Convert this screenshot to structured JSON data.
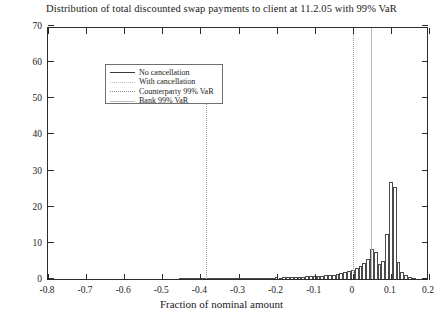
{
  "chart_data": {
    "type": "bar",
    "title": "Distribution of total discounted swap payments to client at 11.2.05 with 99% VaR",
    "xlabel": "Fraction of nominal amount",
    "ylabel": "",
    "xlim": [
      -0.8,
      0.2
    ],
    "ylim": [
      0,
      70
    ],
    "xticks": [
      -0.8,
      -0.7,
      -0.6,
      -0.5,
      -0.4,
      -0.3,
      -0.2,
      -0.1,
      0,
      0.1,
      0.2
    ],
    "xticklabels": [
      "-0.8",
      "-0.7",
      "-0.6",
      "-0.5",
      "-0.4",
      "-0.3",
      "-0.2",
      "-0.1",
      "0",
      "0.1",
      "0.2"
    ],
    "yticks": [
      0,
      10,
      20,
      30,
      40,
      50,
      60,
      70
    ],
    "yticklabels": [
      "0",
      "10",
      "20",
      "30",
      "40",
      "50",
      "60",
      "70"
    ],
    "grid": false,
    "legend_position": "upper left",
    "legend": [
      {
        "label": "No cancellation",
        "style": "solid-dark"
      },
      {
        "label": "With cancellation",
        "style": "dotted-light"
      },
      {
        "label": "Counterparty 99% VaR",
        "style": "dotted-gray"
      },
      {
        "label": "Bank 99% VaR",
        "style": "solid-gray"
      }
    ],
    "bin_width": 0.01,
    "categories": [
      -0.45,
      -0.44,
      -0.43,
      -0.42,
      -0.41,
      -0.4,
      -0.39,
      -0.38,
      -0.37,
      -0.36,
      -0.35,
      -0.34,
      -0.33,
      -0.32,
      -0.31,
      -0.3,
      -0.29,
      -0.28,
      -0.27,
      -0.26,
      -0.25,
      -0.24,
      -0.23,
      -0.22,
      -0.21,
      -0.2,
      -0.19,
      -0.18,
      -0.17,
      -0.16,
      -0.15,
      -0.14,
      -0.13,
      -0.12,
      -0.11,
      -0.1,
      -0.09,
      -0.08,
      -0.07,
      -0.06,
      -0.05,
      -0.04,
      -0.03,
      -0.02,
      -0.01,
      0.0,
      0.01,
      0.02,
      0.03,
      0.04,
      0.05,
      0.06,
      0.07,
      0.08,
      0.09,
      0.1,
      0.11,
      0.12,
      0.13,
      0.14,
      0.15,
      0.16
    ],
    "values": [
      0.3,
      0.2,
      0.2,
      0.3,
      0.2,
      0.3,
      0.2,
      0.3,
      0.2,
      0.2,
      0.3,
      0.2,
      0.3,
      0.2,
      0.3,
      0.3,
      0.2,
      0.3,
      0.3,
      0.4,
      0.3,
      0.4,
      0.3,
      0.4,
      0.4,
      0.5,
      0.4,
      0.5,
      0.5,
      0.6,
      0.5,
      0.6,
      0.6,
      0.7,
      0.7,
      0.8,
      0.8,
      0.9,
      1.0,
      1.1,
      1.2,
      1.4,
      1.6,
      1.9,
      2.2,
      2.6,
      3.0,
      3.6,
      4.4,
      5.6,
      8.2,
      7.6,
      4.2,
      5.0,
      12.5,
      26.8,
      25.4,
      4.6,
      2.0,
      1.0,
      0.6,
      0.3
    ],
    "series_label": "With cancellation",
    "vlines": [
      {
        "name": "counterparty-var-line",
        "x": -0.385,
        "ymin": 0,
        "ymax": 50,
        "style": "dotted",
        "label": "Counterparty 99% VaR"
      },
      {
        "name": "with-cancellation-line",
        "x": 0.0,
        "ymin": 0,
        "ymax": 70,
        "style": "dotted",
        "label": "With cancellation"
      },
      {
        "name": "bank-var-line",
        "x": 0.047,
        "ymin": 0,
        "ymax": 70,
        "style": "solid",
        "label": "Bank 99% VaR"
      }
    ]
  }
}
